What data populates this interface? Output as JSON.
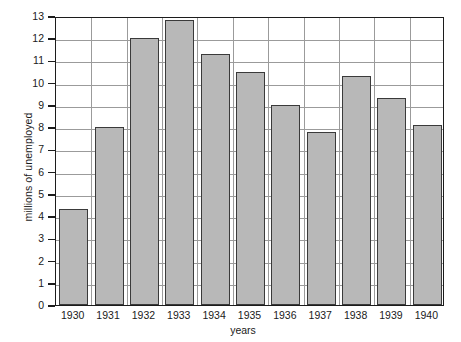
{
  "chart_data": {
    "type": "bar",
    "title": "",
    "xlabel": "years",
    "ylabel": "millions of unemployed",
    "categories": [
      "1930",
      "1931",
      "1932",
      "1933",
      "1934",
      "1935",
      "1936",
      "1937",
      "1938",
      "1939",
      "1940"
    ],
    "values": [
      4.3,
      8.0,
      12.0,
      12.8,
      11.3,
      10.5,
      9.0,
      7.8,
      10.3,
      9.3,
      8.1
    ],
    "ylim": [
      0,
      13
    ],
    "ytick_labels": [
      "0",
      "1",
      "2",
      "3",
      "4",
      "5",
      "6",
      "7",
      "8",
      "9",
      "10",
      "11",
      "12",
      "13"
    ],
    "ytick_values": [
      0,
      1,
      2,
      3,
      4,
      5,
      6,
      7,
      8,
      9,
      10,
      11,
      12,
      13
    ],
    "grid": true,
    "legend": "none",
    "bar_color": "#b8b8b8",
    "bar_edge_color": "#3a3a3a",
    "grid_color": "#9b9b9b",
    "axis_color": "#1c1c1c",
    "text_color": "#1a1a1a",
    "background": "#ffffff"
  }
}
